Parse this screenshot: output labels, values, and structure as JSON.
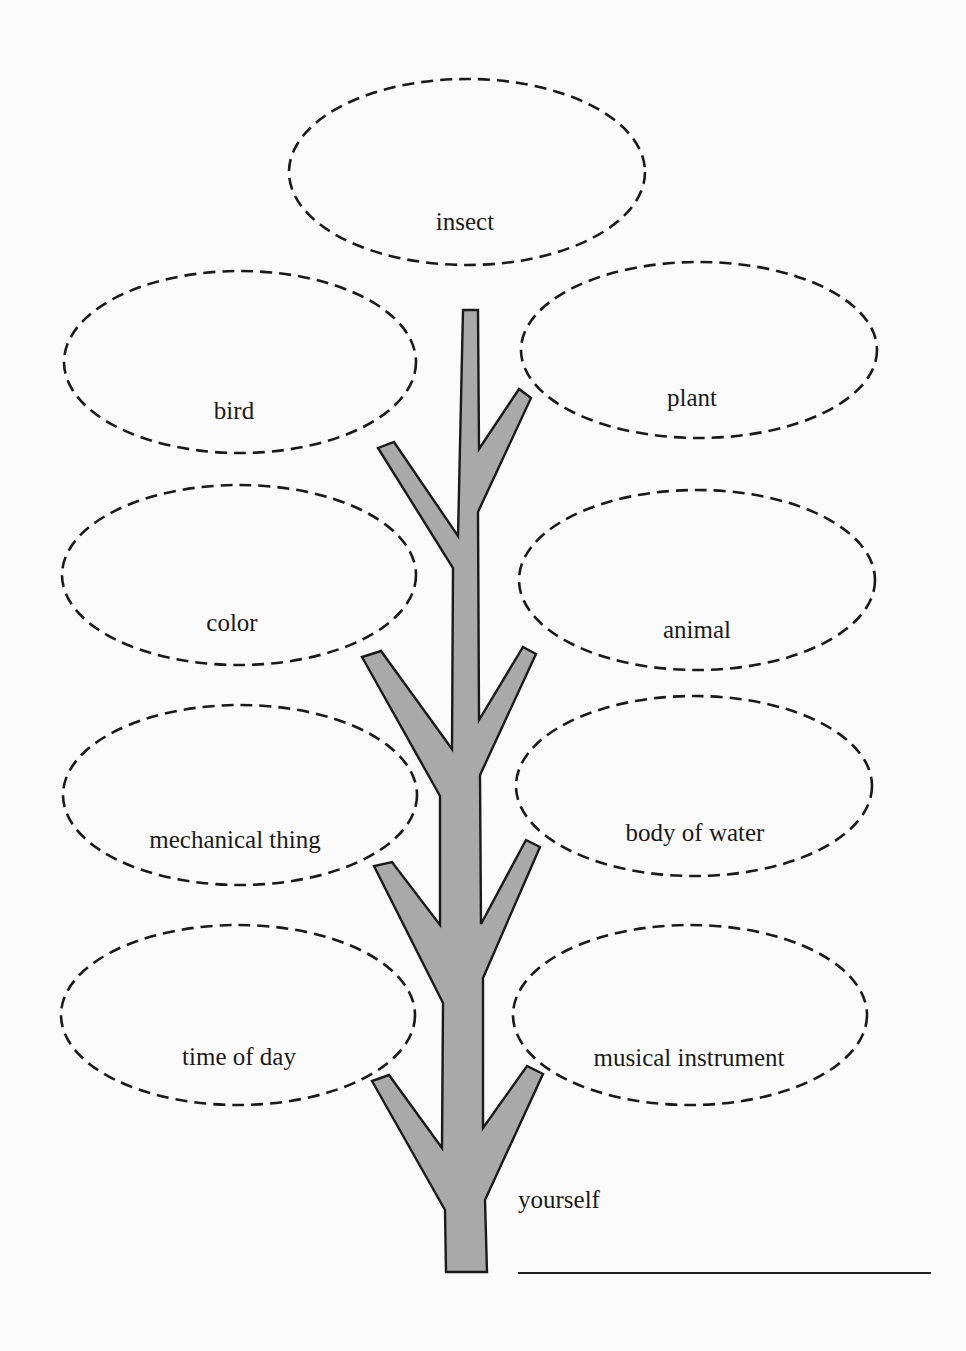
{
  "diagram": {
    "type": "tree worksheet",
    "colors": {
      "trunk_fill": "#a9a9a9",
      "outline": "#1a1a1a",
      "background": "#fbfbfb"
    },
    "bubbles": [
      {
        "id": "insect",
        "label": "insect",
        "side": "top"
      },
      {
        "id": "bird",
        "label": "bird",
        "side": "left"
      },
      {
        "id": "plant",
        "label": "plant",
        "side": "right"
      },
      {
        "id": "color",
        "label": "color",
        "side": "left"
      },
      {
        "id": "animal",
        "label": "animal",
        "side": "right"
      },
      {
        "id": "mechanical-thing",
        "label": "mechanical thing",
        "side": "left"
      },
      {
        "id": "body-of-water",
        "label": "body of water",
        "side": "right"
      },
      {
        "id": "time-of-day",
        "label": "time of day",
        "side": "left"
      },
      {
        "id": "musical-instrument",
        "label": "musical instrument",
        "side": "right"
      }
    ],
    "base": {
      "label": "yourself",
      "answer_line": ""
    }
  }
}
